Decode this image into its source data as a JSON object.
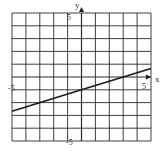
{
  "chart_data": {
    "type": "line",
    "title": "",
    "xlabel": "x",
    "ylabel": "y",
    "xlim": [
      -5,
      5
    ],
    "ylim": [
      -5,
      5
    ],
    "grid": true,
    "grid_step": 1,
    "tick_labels": {
      "x_min": "-5",
      "x_max": "5",
      "y_max": "5",
      "y_min": "-5"
    },
    "series": [
      {
        "name": "line",
        "equation": "y = (1/3)x - 1",
        "x": [
          -5,
          0,
          5
        ],
        "y": [
          -2.67,
          -1,
          0.67
        ]
      }
    ]
  },
  "colors": {
    "grid": "#2a2a2a",
    "line": "#1a1a1a",
    "background": "#ffffff"
  }
}
